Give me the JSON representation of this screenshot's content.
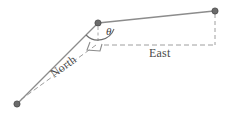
{
  "figure": {
    "background_color": "#ffffff",
    "width": 228,
    "height": 117
  },
  "labels": {
    "east": "East",
    "north": "North",
    "angle": "θ"
  },
  "colors": {
    "solid_line": "#8c8c8c",
    "dashed_line": "#9e9e9e",
    "node_fill": "#6b6b6b",
    "node_stroke": "#4a4a4a",
    "text": "#4a4a4a",
    "arc": "#6e6e6e"
  },
  "diagram_data": {
    "type": "diagram",
    "nodes": [
      {
        "id": "vertex",
        "x": 98,
        "y": 23,
        "shape": "circle",
        "radius": 3
      },
      {
        "id": "east-end",
        "x": 215,
        "y": 11,
        "shape": "circle",
        "radius": 3
      },
      {
        "id": "south-west-end",
        "x": 17,
        "y": 104,
        "shape": "circle",
        "radius": 3
      }
    ],
    "solid_edges": [
      {
        "from": "vertex",
        "to": "east-end"
      },
      {
        "from": "vertex",
        "to": "south-west-end"
      }
    ],
    "dashed_edges": [
      {
        "name": "east-axis",
        "x1": 104,
        "y1": 45,
        "x2": 215,
        "y2": 45
      },
      {
        "name": "north-axis",
        "x1": 95,
        "y1": 46,
        "x2": 19,
        "y2": 101
      },
      {
        "name": "vertical-drop",
        "x1": 215,
        "y1": 14,
        "x2": 215,
        "y2": 45
      },
      {
        "name": "vertex-drop",
        "x1": 98,
        "y1": 26,
        "x2": 98,
        "y2": 44
      }
    ],
    "angle_arc": {
      "label": "θ",
      "center_x": 98,
      "center_y": 23,
      "radius": 17
    },
    "right_angle_marker": {
      "x": 92,
      "y": 44,
      "size": 9
    }
  }
}
